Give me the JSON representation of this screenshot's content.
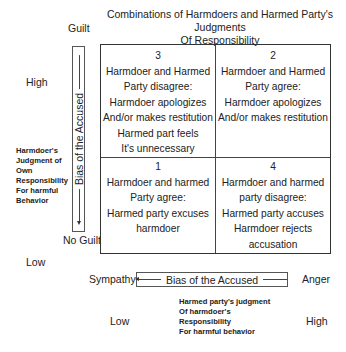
{
  "title": {
    "line1": "Combinations of Harmdoers and Harmed Party's Judgments",
    "line2": "Of Responsibility"
  },
  "y_axis": {
    "top_label": "Guilt",
    "bottom_label": "No Guilt",
    "high_label": "High",
    "low_label": "Low",
    "bias_label": "Bias of the Accused",
    "description": [
      "Harmdoer's",
      "Judgment of",
      "Own",
      "Responsibility",
      "For harmful",
      "Behavior"
    ]
  },
  "x_axis": {
    "left_label": "Sympathy",
    "right_label": "Anger",
    "low_label": "Low",
    "high_label": "High",
    "bias_label": "Bias of the Accused",
    "description": [
      "Harmed party's judgment",
      "Of harmdoer's",
      "Responsibility",
      "For harmful behavior"
    ]
  },
  "cells": {
    "top_left": {
      "number": "3",
      "lines": [
        "Harmdoer and Harmed",
        "Party disagree:",
        "Harmdoer apologizes",
        "And/or makes restitution",
        "Harmed part feels",
        "It's unnecessary"
      ]
    },
    "top_right": {
      "number": "2",
      "lines": [
        "Harmdoer and Harmed",
        "Party agree:",
        "Harmdoer apologizes",
        "And/or makes restitution"
      ]
    },
    "bottom_left": {
      "number": "1",
      "lines": [
        "Harmdoer and harmed",
        "Party agree:",
        "Harmed party excuses",
        "harmdoer"
      ]
    },
    "bottom_right": {
      "number": "4",
      "lines": [
        "Harmdoer and harmed",
        "party disagree:",
        "Harmed party accuses",
        "Harmdoer rejects",
        "accusation"
      ]
    }
  }
}
